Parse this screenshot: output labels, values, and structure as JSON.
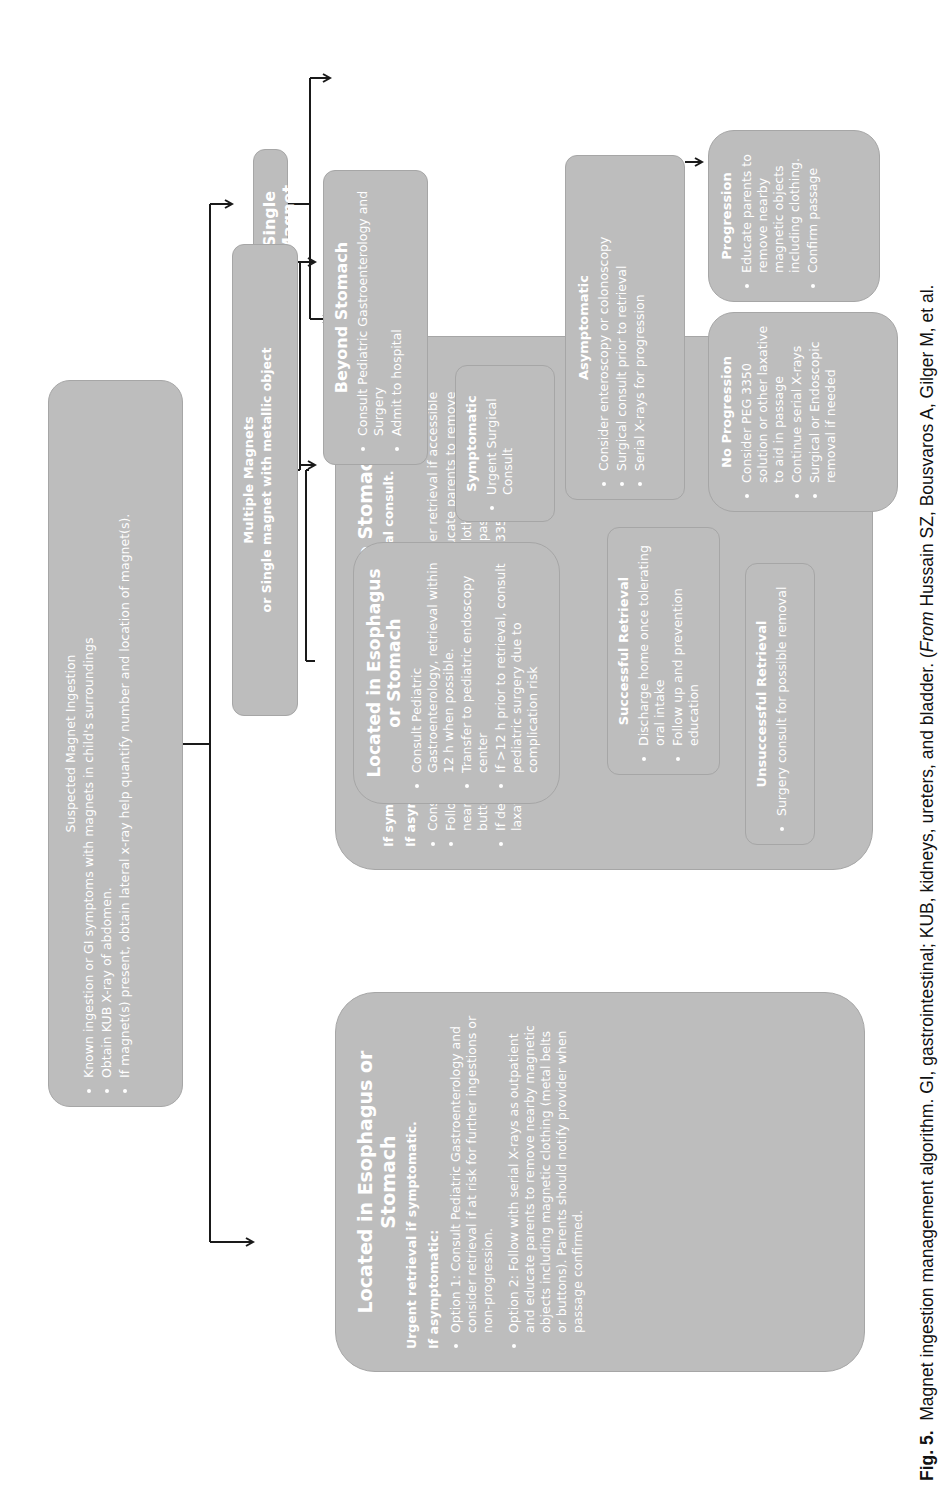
{
  "diagram": {
    "type": "flowchart",
    "orientation": "rotated-90-ccw",
    "start": {
      "title": "Suspected Magnet Ingestion",
      "bullets": [
        "Known ingestion or GI symptoms with magnets in child's surroundings",
        "Obtain KUB X-ray of abdomen.",
        "If magnet(s) present, obtain lateral x-ray help quantify number and location of magnet(s)."
      ]
    },
    "single": {
      "title": "Single Magnet",
      "esophagus": {
        "title": "Located in Esophagus or Stomach",
        "para1": "Urgent retrieval if symptomatic.",
        "para2": "If asymptomatic:",
        "bullets": [
          "Option 1: Consult Pediatric Gastroenterology and consider retrieval if at risk for further ingestions or non-progression.",
          "Option 2: Follow with serial X-rays as outpatient and educate parents to remove nearby magnetic objects including magnetic clothing (metal belts or buttons). Parents should notify provider when passage confirmed."
        ]
      },
      "beyond": {
        "title": "Located Beyond the Stomach",
        "para1": "If symptomatic, admit with NPO and surgical consult.",
        "para2": "If asymptomatic:",
        "bullets": [
          "Consult Pediatric Gastroenterology and consider retrieval if accessible",
          "Follow with serial X-rays as outpatient and educate parents to remove nearby magnetic objects including magnetic clothing (metal belts or buttons). Parents should notify provider when passage confirmed.",
          "If delay in progression on X-ray, consider PEG 3350 solution or other laxative to aid in passage"
        ]
      }
    },
    "multiple": {
      "title": "Multiple Magnets",
      "subtitle": "or Single magnet with metallic object",
      "esophagus": {
        "title": "Located in Esophagus or Stomach",
        "bullets": [
          "Consult Pediatric Gastroenterology, retrieval within 12 h when possible.",
          "Transfer to pediatric endoscopy center",
          "If >12 h prior to retrieval, consult pediatric surgery due to complication risk"
        ]
      },
      "beyond": {
        "title": "Beyond Stomach",
        "bullets": [
          "Consult Pediatric Gastroenterology and Surgery",
          "Admit to hospital"
        ]
      },
      "symptomatic": {
        "title": "Symptomatic",
        "bullets": [
          "Urgent Surgical Consult"
        ]
      },
      "asymptomatic": {
        "title": "Asymptomatic",
        "bullets": [
          "Consider enteroscopy or colonoscopy",
          "Surgical consult prior to retrieval",
          "Serial X-rays for progression"
        ]
      },
      "successful": {
        "title": "Successful Retrieval",
        "bullets": [
          "Discharge home once tolerating oral intake",
          "Follow up and prevention education"
        ]
      },
      "unsuccessful": {
        "title": "Unsuccessful Retrieval",
        "bullets": [
          "Surgery consult for possible removal"
        ]
      },
      "no_progression": {
        "title": "No Progression",
        "bullets": [
          "Consider PEG 3350 solution or other laxative to aid in passage",
          "Continue serial X-rays",
          "Surgical or Endoscopic removal if needed"
        ]
      },
      "progression": {
        "title": "Progression",
        "bullets": [
          "Educate parents to remove nearby magnetic objects including clothing.",
          "Confirm passage"
        ]
      }
    }
  },
  "caption": {
    "label": "Fig. 5.",
    "text": "Magnet ingestion management algorithm. GI, gastrointestinal; KUB, kidneys, ureters, and bladder. (",
    "from": "From",
    "source": " Hussain SZ, Bousvaros A, Gilger M, et al."
  },
  "colors": {
    "box_fill": "#bdbdbd",
    "box_border": "#a6a6a6",
    "box_text": "#ffffff",
    "connector": "#1a1a1a"
  }
}
